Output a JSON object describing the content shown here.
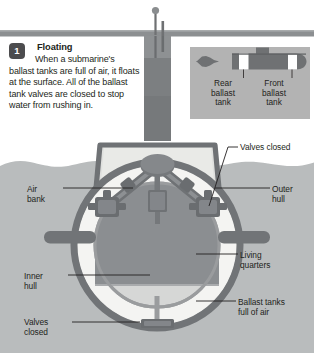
{
  "page": {
    "background": "#ffffff"
  },
  "step": {
    "number": "1",
    "heading": "Floating",
    "body": "When a submarine's ballast tanks are full of air, it floats at the surface. All of the ballast tank valves are closed to stop water from rushing in."
  },
  "inset": {
    "name": "side-view-submarine-inset",
    "background": "#b3b3b3",
    "labels": {
      "rear": "Rear\nballast\ntank",
      "front": "Front\nballast\ntank"
    }
  },
  "callouts": {
    "valves_closed_top": "Valves closed",
    "air_bank": "Air\nbank",
    "outer_hull": "Outer\nhull",
    "living_quarters": "Living\nquarters",
    "inner_hull": "Inner\nhull",
    "ballast_tanks": "Ballast tanks\nfull of air",
    "valves_closed_bottom": "Valves\nclosed"
  },
  "colors": {
    "water": "#b9bcbd",
    "waterline_bar": "#8c8f91",
    "hull_dark": "#7f8285",
    "hull_mid": "#97999c",
    "living_quarters": "#8c8f92",
    "ballast_white": "#f2f2f0",
    "inner_fill": "#d9dada",
    "badge": "#4c4c4e",
    "text": "#231f20",
    "leader_line": "#231f20"
  },
  "diagram": {
    "type": "cross-section",
    "view": "bow-on cutaway of a submarine floating at the surface",
    "elements": [
      "conning-tower",
      "periscope-mast",
      "antenna-mast",
      "outer-hull",
      "inner-hull",
      "ballast-tanks",
      "living-quarters",
      "air-bank",
      "valve-assembly-left",
      "valve-assembly-right",
      "valve-assembly-bottom",
      "hydroplane-left",
      "hydroplane-right",
      "waterline"
    ]
  }
}
